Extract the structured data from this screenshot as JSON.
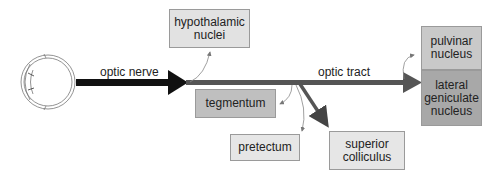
{
  "diagram": {
    "labels": {
      "optic_nerve": "optic nerve",
      "optic_tract": "optic tract"
    },
    "nodes": {
      "hypothalamic": {
        "line1": "hypothalamic",
        "line2": "nuclei",
        "color": "#e2e2e2"
      },
      "tegmentum": {
        "line1": "tegmentum",
        "color": "#bfbfbf"
      },
      "pretectum": {
        "line1": "pretectum",
        "color": "#e6e6e6"
      },
      "superior_colliculus": {
        "line1": "superior",
        "line2": "colliculus",
        "color": "#e6e6e6"
      },
      "pulvinar": {
        "line1": "pulvinar",
        "line2": "nucleus",
        "color": "#c9c9c9"
      },
      "lgn": {
        "line1": "lateral",
        "line2": "geniculate",
        "line3": "nucleus",
        "color": "#a8a8a8"
      }
    },
    "colors": {
      "optic_nerve": "#111111",
      "optic_tract": "#555555"
    }
  }
}
